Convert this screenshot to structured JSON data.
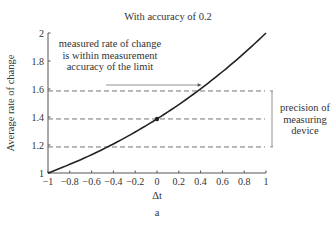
{
  "chart_data": {
    "type": "line",
    "title": "With accuracy of 0.2",
    "xlabel": "Δt",
    "ylabel": "Average rate of change",
    "panel_label": "a",
    "xlim": [
      -1,
      1
    ],
    "ylim": [
      1,
      2
    ],
    "x_ticks": [
      "−1",
      "−0.8",
      "−0.6",
      "−0.4",
      "−0.2",
      "0",
      "0.2",
      "0.4",
      "0.6",
      "0.8",
      "1"
    ],
    "y_ticks": [
      "1",
      "1.2",
      "1.4",
      "1.6",
      "1.8",
      "2"
    ],
    "grid": false,
    "series": [
      {
        "name": "average rate of change",
        "x": [
          -1,
          -0.8,
          -0.6,
          -0.4,
          -0.2,
          0,
          0.2,
          0.4,
          0.6,
          0.8,
          1
        ],
        "values": [
          1.0,
          1.07,
          1.14,
          1.22,
          1.3,
          1.386,
          1.48,
          1.6,
          1.72,
          1.86,
          2.0
        ]
      }
    ],
    "highlight_point": {
      "x": 0,
      "y": 1.386
    },
    "reference_lines": [
      1.186,
      1.386,
      1.586
    ],
    "annotations": [
      {
        "text_lines": [
          "measured rate of change",
          "is within measurement",
          "accuracy of the limit"
        ],
        "arrow_to": {
          "x": 0.41,
          "y": 1.6
        }
      },
      {
        "text_lines": [
          "precision of",
          "measuring",
          "device"
        ],
        "bracket": [
          1.186,
          1.586
        ]
      }
    ]
  }
}
